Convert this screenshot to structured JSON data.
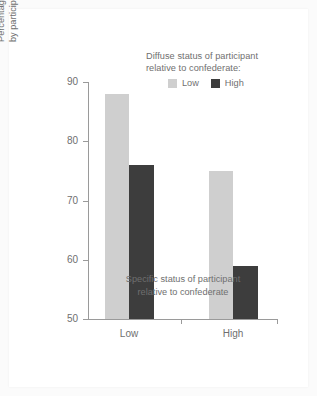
{
  "chart_data": {
    "type": "bar",
    "title": "",
    "subtitle": "",
    "categories": [
      "Low",
      "High"
    ],
    "series": [
      {
        "name": "Low",
        "values": [
          88,
          75
        ],
        "color": "#cfcfcf"
      },
      {
        "name": "High",
        "values": [
          76,
          59
        ],
        "color": "#3d3d3d"
      }
    ],
    "xlabel_lines": [
      "Specific status of participant",
      "relative to confederate"
    ],
    "ylabel_lines": [
      "Percentage yielding responses",
      "by participants to confederate"
    ],
    "yticks": [
      50,
      60,
      70,
      80,
      90
    ],
    "ylim": [
      50,
      90
    ],
    "grid": false,
    "legend": {
      "position": "top-right",
      "title_lines": [
        "Diffuse status of participant",
        "relative to confederate:"
      ],
      "entries": [
        {
          "label": "Low",
          "color": "#cfcfcf"
        },
        {
          "label": "High",
          "color": "#3d3d3d"
        }
      ]
    }
  },
  "colors": {
    "light_bar": "#cfcfcf",
    "dark_bar": "#3d3d3d",
    "axis": "#9a9a9a",
    "text": "#6f6f6f",
    "page_background": "#fbfbfb",
    "card_background": "#ffffff"
  }
}
